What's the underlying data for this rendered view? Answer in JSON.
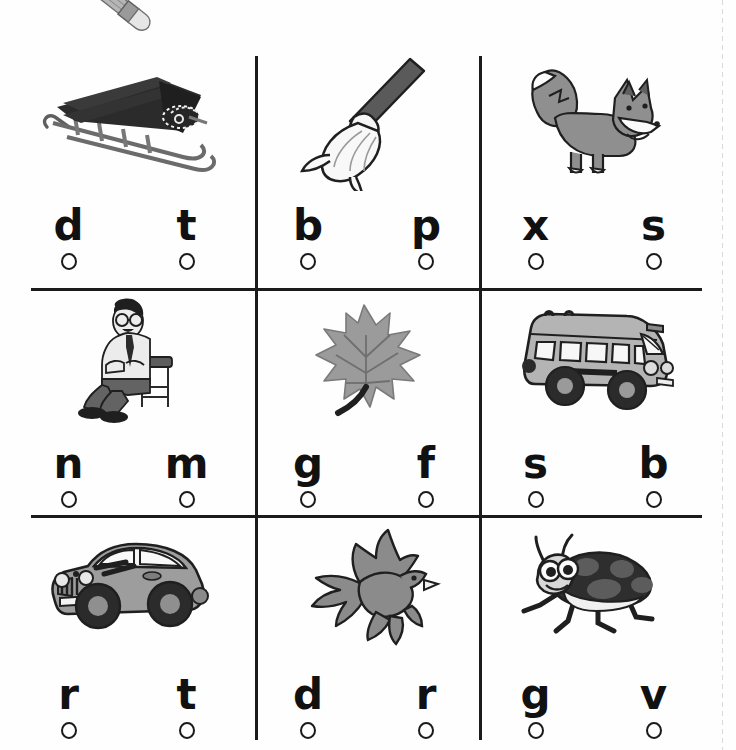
{
  "worksheet": {
    "title": "Beginning Sounds Letter Choice Worksheet",
    "decorations": {
      "pencil_icon": "pencil-icon",
      "page_edge": "page-edge-dashed-line"
    },
    "ink_color": "#1b1b1b",
    "art_fill_color": "#8f8f8f"
  },
  "cells": [
    {
      "id": "cell-1",
      "picture": "sled",
      "picture_icon": "sled-icon",
      "choices": [
        {
          "letter": "d",
          "bubble": "answer-bubble"
        },
        {
          "letter": "t",
          "bubble": "answer-bubble"
        }
      ]
    },
    {
      "id": "cell-2",
      "picture": "broom",
      "picture_icon": "broom-icon",
      "choices": [
        {
          "letter": "b",
          "bubble": "answer-bubble"
        },
        {
          "letter": "p",
          "bubble": "answer-bubble"
        }
      ]
    },
    {
      "id": "cell-3",
      "picture": "fox",
      "picture_icon": "fox-icon",
      "choices": [
        {
          "letter": "x",
          "bubble": "answer-bubble"
        },
        {
          "letter": "s",
          "bubble": "answer-bubble"
        }
      ]
    },
    {
      "id": "cell-4",
      "picture": "man-sitting-on-chair",
      "picture_icon": "man-on-chair-icon",
      "choices": [
        {
          "letter": "n",
          "bubble": "answer-bubble"
        },
        {
          "letter": "m",
          "bubble": "answer-bubble"
        }
      ]
    },
    {
      "id": "cell-5",
      "picture": "leaf",
      "picture_icon": "leaf-icon",
      "choices": [
        {
          "letter": "g",
          "bubble": "answer-bubble"
        },
        {
          "letter": "f",
          "bubble": "answer-bubble"
        }
      ]
    },
    {
      "id": "cell-6",
      "picture": "bus",
      "picture_icon": "bus-icon",
      "choices": [
        {
          "letter": "s",
          "bubble": "answer-bubble"
        },
        {
          "letter": "b",
          "bubble": "answer-bubble"
        }
      ]
    },
    {
      "id": "cell-7",
      "picture": "car",
      "picture_icon": "car-icon",
      "choices": [
        {
          "letter": "r",
          "bubble": "answer-bubble"
        },
        {
          "letter": "t",
          "bubble": "answer-bubble"
        }
      ]
    },
    {
      "id": "cell-8",
      "picture": "bird",
      "picture_icon": "bird-icon",
      "choices": [
        {
          "letter": "d",
          "bubble": "answer-bubble"
        },
        {
          "letter": "r",
          "bubble": "answer-bubble"
        }
      ]
    },
    {
      "id": "cell-9",
      "picture": "ladybug",
      "picture_icon": "ladybug-icon",
      "choices": [
        {
          "letter": "g",
          "bubble": "answer-bubble"
        },
        {
          "letter": "v",
          "bubble": "answer-bubble"
        }
      ]
    }
  ]
}
